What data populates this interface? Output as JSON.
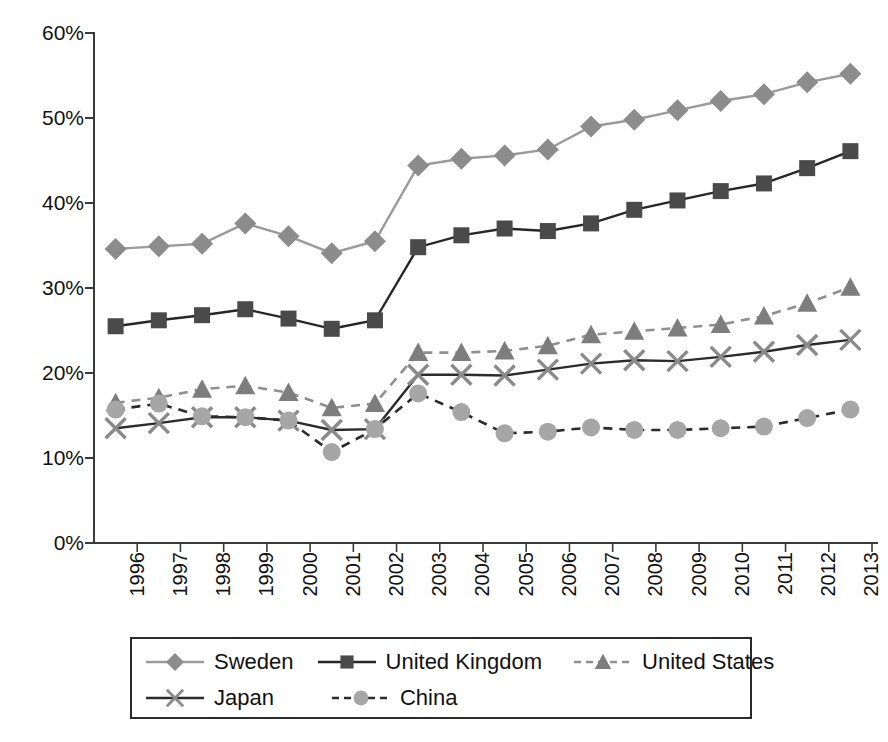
{
  "chart_data": {
    "type": "line",
    "title": "",
    "subtitle": "",
    "xlabel": "",
    "ylabel": "",
    "grid": false,
    "legend_position": "bottom",
    "xlim": [
      1996,
      2013
    ],
    "ylim": [
      0,
      60
    ],
    "ytick_labels": [
      "60%",
      "50%",
      "40%",
      "30%",
      "20%",
      "10%",
      "0%"
    ],
    "ytick_values": [
      60,
      50,
      40,
      30,
      20,
      10,
      0
    ],
    "ytick_suffix": "%",
    "x": [
      1996,
      1997,
      1998,
      1999,
      2000,
      2001,
      2002,
      2003,
      2004,
      2005,
      2006,
      2007,
      2008,
      2009,
      2010,
      2011,
      2012,
      2013
    ],
    "categories": [
      "1996",
      "1997",
      "1998",
      "1999",
      "2000",
      "2001",
      "2002",
      "2003",
      "2004",
      "2005",
      "2006",
      "2007",
      "2008",
      "2009",
      "2010",
      "2011",
      "2012",
      "2013"
    ],
    "series": [
      {
        "name": "Sweden",
        "marker": "diamond",
        "linestyle": "solid",
        "color": "#9a9a9a",
        "marker_color": "#8c8c8c",
        "values": [
          34.6,
          34.9,
          35.2,
          37.6,
          36.1,
          34.1,
          35.5,
          44.4,
          45.2,
          45.6,
          46.3,
          49.0,
          49.8,
          50.9,
          52.0,
          52.8,
          54.2,
          55.2
        ]
      },
      {
        "name": "United Kingdom",
        "marker": "square",
        "linestyle": "solid",
        "color": "#262626",
        "marker_color": "#4a4a4a",
        "values": [
          25.5,
          26.2,
          26.8,
          27.5,
          26.4,
          25.2,
          26.2,
          34.8,
          36.2,
          37.0,
          36.7,
          37.6,
          39.2,
          40.3,
          41.4,
          42.3,
          44.1,
          46.1
        ]
      },
      {
        "name": "United States",
        "marker": "triangle",
        "linestyle": "dashed",
        "color": "#8f8f8f",
        "marker_color": "#7d7d7d",
        "values": [
          16.5,
          17.1,
          18.1,
          18.5,
          17.7,
          15.9,
          16.4,
          22.4,
          22.4,
          22.6,
          23.2,
          24.5,
          24.9,
          25.3,
          25.7,
          26.7,
          28.2,
          30.1
        ]
      },
      {
        "name": "Japan",
        "marker": "x",
        "linestyle": "solid",
        "color": "#2b2b2b",
        "marker_color": "#8a8a8a",
        "values": [
          13.5,
          14.1,
          14.8,
          14.8,
          14.4,
          13.3,
          13.4,
          19.8,
          19.8,
          19.7,
          20.4,
          21.1,
          21.5,
          21.4,
          21.9,
          22.5,
          23.3,
          23.9
        ]
      },
      {
        "name": "China",
        "marker": "circle",
        "linestyle": "dashed",
        "color": "#2b2b2b",
        "marker_color": "#a6a6a6",
        "values": [
          15.7,
          16.4,
          14.9,
          14.8,
          14.4,
          10.7,
          13.4,
          17.6,
          15.4,
          12.9,
          13.1,
          13.6,
          13.3,
          13.3,
          13.5,
          13.7,
          14.7,
          15.7
        ]
      }
    ]
  },
  "legend": {
    "rows": [
      [
        {
          "label": "Sweden",
          "marker": "diamond-marker-icon",
          "series_index": 0
        },
        {
          "label": "United Kingdom",
          "marker": "square-marker-icon",
          "series_index": 1
        },
        {
          "label": "United States",
          "marker": "triangle-marker-icon",
          "series_index": 2
        }
      ],
      [
        {
          "label": "Japan",
          "marker": "x-marker-icon",
          "series_index": 3
        },
        {
          "label": "China",
          "marker": "circle-marker-icon",
          "series_index": 4
        }
      ]
    ]
  },
  "axes": {
    "axis_color": "#3a3a3a",
    "tick_length": 8
  }
}
